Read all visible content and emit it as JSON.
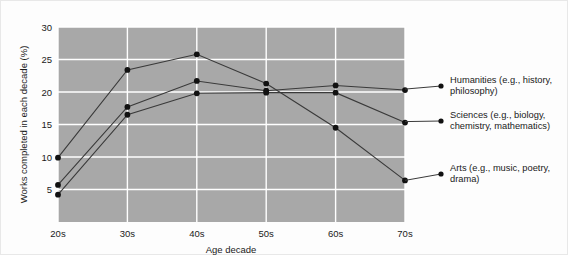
{
  "chart_data": {
    "type": "line",
    "title": "",
    "xlabel": "Age decade",
    "ylabel": "Works completed in each decade (%)",
    "categories": [
      "20s",
      "30s",
      "40s",
      "50s",
      "60s",
      "70s"
    ],
    "xtick_labels": [
      "20s",
      "30s",
      "40s",
      "50s",
      "60s",
      "70s"
    ],
    "ytick_labels": [
      "5",
      "10",
      "15",
      "20",
      "25",
      "30"
    ],
    "ytick_values": [
      5,
      10,
      15,
      20,
      25,
      30
    ],
    "ylim": [
      0,
      30
    ],
    "grid": true,
    "legend_position": "right-inline-annotations",
    "plot_background": "#a8a8a8",
    "series": [
      {
        "name": "Humanities (e.g., history, philosophy)",
        "values": [
          5.7,
          17.7,
          21.7,
          20.2,
          21.0,
          20.3
        ]
      },
      {
        "name": "Sciences (e.g., biology, chemistry, mathematics)",
        "values": [
          4.2,
          16.5,
          19.8,
          19.9,
          19.9,
          15.3
        ]
      },
      {
        "name": "Arts (e.g., music, poetry, drama)",
        "values": [
          9.9,
          23.4,
          25.8,
          21.3,
          14.5,
          6.4
        ]
      }
    ]
  },
  "legend": {
    "entries": [
      {
        "line1": "Humanities (e.g., history,",
        "line2": "philosophy)"
      },
      {
        "line1": "Sciences (e.g., biology,",
        "line2": "chemistry, mathematics)"
      },
      {
        "line1": "Arts (e.g., music, poetry,",
        "line2": "drama)"
      }
    ]
  }
}
